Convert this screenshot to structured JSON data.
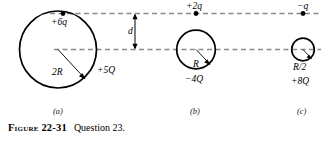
{
  "figure": {
    "caption_number": "Figure 22-31",
    "caption_text": "Question 23.",
    "dimension_label": "d",
    "panels": [
      {
        "tag": "(a)",
        "point_charge": "+6q",
        "radius_label": "2R",
        "shell_charge": "+5Q"
      },
      {
        "tag": "(b)",
        "point_charge": "+2q",
        "radius_label": "R",
        "shell_charge": "−4Q"
      },
      {
        "tag": "(c)",
        "point_charge": "−q",
        "radius_label": "R/2",
        "shell_charge": "+8Q"
      }
    ]
  },
  "colors": {
    "ink": "#000000",
    "dashed_guide": "#8a8a8a",
    "background": "#ffffff"
  }
}
